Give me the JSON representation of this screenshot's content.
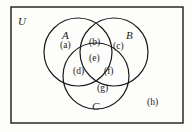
{
  "figure": {
    "type": "venn-diagram-3-set",
    "background_color": "#fdfdfc",
    "stroke_color": "#1a1a1a",
    "universe": {
      "label": "U",
      "shape": "rectangle",
      "bounds": {
        "x": 11,
        "y": 7,
        "width": 172,
        "height": 116
      },
      "label_position": {
        "x": 18,
        "y": 16
      }
    },
    "sets": [
      {
        "name": "set-a",
        "label": "A",
        "center": {
          "x": 78,
          "y": 52
        },
        "radius": 34,
        "label_position": {
          "x": 62,
          "y": 30
        }
      },
      {
        "name": "set-b",
        "label": "B",
        "center": {
          "x": 114,
          "y": 52
        },
        "radius": 34,
        "label_position": {
          "x": 126,
          "y": 30
        }
      },
      {
        "name": "set-c",
        "label": "C",
        "center": {
          "x": 96,
          "y": 76
        },
        "radius": 33,
        "label_position": {
          "x": 92,
          "y": 101
        }
      }
    ],
    "regions": [
      {
        "name": "region-a",
        "label": "(a)",
        "meaning": "A only",
        "position": {
          "x": 60,
          "y": 41
        }
      },
      {
        "name": "region-b",
        "label": "(b)",
        "meaning": "A intersect B only",
        "position": {
          "x": 89,
          "y": 38
        }
      },
      {
        "name": "region-c",
        "label": "(c)",
        "meaning": "B only",
        "position": {
          "x": 113,
          "y": 42
        }
      },
      {
        "name": "region-d",
        "label": "(d)",
        "meaning": "A intersect C only",
        "position": {
          "x": 73,
          "y": 67
        }
      },
      {
        "name": "region-e",
        "label": "(e)",
        "meaning": "A intersect B intersect C",
        "position": {
          "x": 89,
          "y": 54
        }
      },
      {
        "name": "region-f",
        "label": "(f)",
        "meaning": "B intersect C only",
        "position": {
          "x": 104,
          "y": 67
        }
      },
      {
        "name": "region-g",
        "label": "(g)",
        "meaning": "C only",
        "position": {
          "x": 97,
          "y": 84
        }
      },
      {
        "name": "region-h",
        "label": "(h)",
        "meaning": "outside all sets",
        "position": {
          "x": 147,
          "y": 98
        }
      }
    ]
  }
}
